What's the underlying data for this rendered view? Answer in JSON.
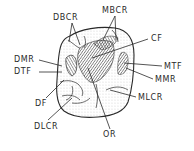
{
  "diagram": {
    "colors": {
      "ink": "#2a2a2a",
      "background": "#ffffff"
    },
    "labels": {
      "dbcr": {
        "text": "DBCR",
        "x": 53,
        "y": 14
      },
      "mbcr": {
        "text": "MBCR",
        "x": 102,
        "y": 7
      },
      "cf": {
        "text": "CF",
        "x": 151,
        "y": 35
      },
      "dmr": {
        "text": "DMR",
        "x": 14,
        "y": 56
      },
      "dtf": {
        "text": "DTF",
        "x": 14,
        "y": 68
      },
      "mtf": {
        "text": "MTF",
        "x": 164,
        "y": 63
      },
      "mmr": {
        "text": "MMR",
        "x": 155,
        "y": 76
      },
      "df": {
        "text": "DF",
        "x": 35,
        "y": 100
      },
      "mlcr": {
        "text": "MLCR",
        "x": 138,
        "y": 94
      },
      "dlcr": {
        "text": "DLCR",
        "x": 34,
        "y": 123
      },
      "or": {
        "text": "OR",
        "x": 103,
        "y": 131
      }
    }
  }
}
